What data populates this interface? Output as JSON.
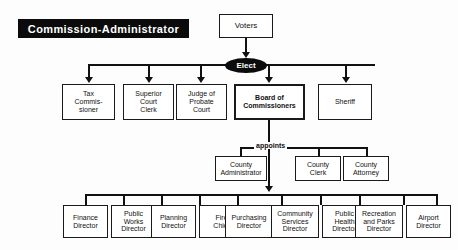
{
  "title": {
    "text": "Commission-Administrator"
  },
  "colors": {
    "banner_bg": "#0b0b0b",
    "banner_text": "#ffffff",
    "oval_bg": "#0b0b0b",
    "oval_text": "#ffffff",
    "line": "#111111",
    "box_border": "#1a1a1a",
    "background": "#fdfdfd"
  },
  "nodes": {
    "voters": {
      "label": "Voters"
    },
    "elect": {
      "label": "Elect"
    },
    "appoints": {
      "label": "appoints"
    },
    "tax_commissioner": {
      "line1": "Tax",
      "line2": "Commis-",
      "line3": "sioner"
    },
    "superior_court_clerk": {
      "line1": "Superior",
      "line2": "Court",
      "line3": "Clerk"
    },
    "judge_probate_court": {
      "line1": "Judge of",
      "line2": "Probate",
      "line3": "Court"
    },
    "board_of_commissioners": {
      "line1": "Board of",
      "line2": "Commissioners"
    },
    "sheriff": {
      "line1": "Sheriff"
    },
    "county_administrator": {
      "line1": "County",
      "line2": "Administrator"
    },
    "county_clerk": {
      "line1": "County",
      "line2": "Clerk"
    },
    "county_attorney": {
      "line1": "County",
      "line2": "Attorney"
    },
    "finance_director": {
      "line1": "Finance",
      "line2": "Director"
    },
    "public_works_director": {
      "line1": "Public",
      "line2": "Works",
      "line3": "Director"
    },
    "planning_director": {
      "line1": "Planning",
      "line2": "Director"
    },
    "fire_chief": {
      "line1": "Fire",
      "line2": "Chief"
    },
    "purchasing_director": {
      "line1": "Purchasing",
      "line2": "Director"
    },
    "community_services_director": {
      "line1": "Community",
      "line2": "Services",
      "line3": "Director"
    },
    "public_health_director": {
      "line1": "Public",
      "line2": "Health",
      "line3": "Director"
    },
    "recreation_parks_director": {
      "line1": "Recreation",
      "line2": "and Parks",
      "line3": "Director"
    },
    "airport_director": {
      "line1": "Airport",
      "line2": "Director"
    }
  }
}
